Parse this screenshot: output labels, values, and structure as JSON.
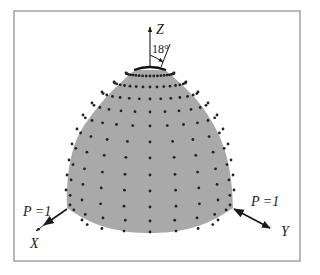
{
  "figure": {
    "colors": {
      "background": "#ffffff",
      "border": "#8a8a8a",
      "shell": "#a9a9a9",
      "node": "#222222",
      "ink": "#1a1a1a"
    },
    "border": {
      "x": 14,
      "y": 11,
      "w": 286,
      "h": 250
    },
    "axes": {
      "z": {
        "label": "Z"
      },
      "x": {
        "label": "X"
      },
      "y": {
        "label": "Y"
      }
    },
    "hole_angle": {
      "label": "18°",
      "value_deg": 18
    },
    "loads": [
      {
        "label": "P =1",
        "value": 1,
        "direction": "along X"
      },
      {
        "label": "P =1",
        "value": 1,
        "direction": "along Y"
      }
    ],
    "outline": "M135,70 L165,70 C182,84 200,100 212,122 C224,142 232,165 233,208 C205,228 178,233 150,233 C122,233 95,228 67,208 C66,170 72,140 88,120 C102,100 118,84 135,70 Z",
    "node_rows": [
      {
        "y": 76,
        "rx": 24,
        "sag": 3,
        "n": 21
      },
      {
        "y": 87,
        "rx": 36,
        "sag": 5,
        "n": 17
      },
      {
        "y": 99,
        "rx": 48,
        "sag": 7,
        "n": 15
      },
      {
        "y": 112,
        "rx": 58,
        "sag": 9,
        "n": 13
      },
      {
        "y": 126,
        "rx": 67,
        "sag": 11,
        "n": 13
      },
      {
        "y": 142,
        "rx": 73,
        "sag": 13,
        "n": 11
      },
      {
        "y": 158,
        "rx": 78,
        "sag": 14,
        "n": 11
      },
      {
        "y": 175,
        "rx": 81,
        "sag": 15,
        "n": 11
      },
      {
        "y": 191,
        "rx": 83,
        "sag": 16,
        "n": 11
      },
      {
        "y": 207,
        "rx": 84,
        "sag": 17,
        "n": 11
      },
      {
        "y": 221,
        "rx": 80,
        "sag": 16,
        "n": 11
      },
      {
        "y": 232,
        "rx": 68,
        "sag": 12,
        "n": 9
      }
    ]
  }
}
